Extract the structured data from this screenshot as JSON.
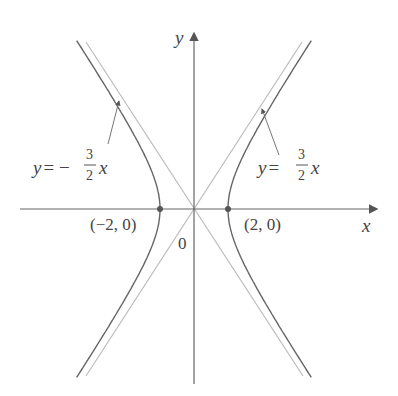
{
  "chart_data": {
    "type": "line",
    "title": "",
    "xlabel": "x",
    "ylabel": "y",
    "grid": false,
    "origin_label": "0",
    "vertices": [
      {
        "x": -2,
        "y": 0,
        "label": "(−2, 0)"
      },
      {
        "x": 2,
        "y": 0,
        "label": "(2, 0)"
      }
    ],
    "series": [
      {
        "name": "hyperbola",
        "equation": "x^2/4 - y^2/9 = 1",
        "a": 2,
        "b": 3
      },
      {
        "name": "asymptote-negative",
        "equation": "y = -3/2 x",
        "slope": -1.5
      },
      {
        "name": "asymptote-positive",
        "equation": "y = 3/2 x",
        "slope": 1.5
      }
    ],
    "annotations": [
      {
        "text_prefix": "y = −",
        "num": "3",
        "den": "2",
        "text_suffix": "x",
        "points_to": "asymptote-negative"
      },
      {
        "text_prefix": "y = ",
        "num": "3",
        "den": "2",
        "text_suffix": "x",
        "points_to": "asymptote-positive"
      }
    ]
  },
  "labels": {
    "x_axis": "x",
    "y_axis": "y",
    "origin": "0",
    "vertex_left": "(−2, 0)",
    "vertex_right": "(2, 0)",
    "asym_left_prefix": "y = −",
    "asym_left_num": "3",
    "asym_left_den": "2",
    "asym_left_x": "x",
    "asym_right_prefix": "y = ",
    "asym_right_num": "3",
    "asym_right_den": "2",
    "asym_right_x": "x"
  },
  "colors": {
    "curve": "#666666",
    "asymptote": "#bbbbbb",
    "axis": "#666666",
    "text": "#444444"
  }
}
